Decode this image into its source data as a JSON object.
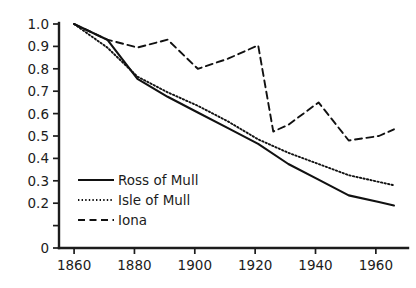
{
  "chart_data": {
    "type": "line",
    "title": "",
    "subtitle": "",
    "xlabel": "",
    "ylabel": "",
    "xlim": [
      1855,
      1968
    ],
    "ylim": [
      0,
      1.0
    ],
    "grid": false,
    "legend_position": "inside-lower-left",
    "x_ticks": [
      1860,
      1880,
      1900,
      1920,
      1940,
      1960
    ],
    "x_tick_labels": [
      "1860",
      "1880",
      "1900",
      "1920",
      "1940",
      "1960"
    ],
    "y_ticks": [
      0,
      0.1,
      0.2,
      0.3,
      0.4,
      0.5,
      0.6,
      0.7,
      0.8,
      0.9,
      1.0
    ],
    "y_tick_labels": [
      "0",
      "",
      "0.2",
      "0.3",
      "0.4",
      "0.5",
      "0.6",
      "0.7",
      "0.8",
      "0.9",
      "1.0"
    ],
    "series": [
      {
        "name": "Ross of Mull",
        "style": "solid",
        "color": "#111111",
        "x": [
          1860,
          1871,
          1881,
          1891,
          1901,
          1911,
          1921,
          1931,
          1941,
          1951,
          1961,
          1966
        ],
        "values": [
          1.0,
          0.93,
          0.755,
          0.675,
          0.605,
          0.535,
          0.465,
          0.375,
          0.305,
          0.235,
          0.205,
          0.19
        ]
      },
      {
        "name": "Isle of Mull",
        "style": "dotted",
        "color": "#111111",
        "x": [
          1860,
          1871,
          1881,
          1891,
          1901,
          1911,
          1921,
          1931,
          1941,
          1951,
          1961,
          1966
        ],
        "values": [
          1.0,
          0.895,
          0.765,
          0.695,
          0.635,
          0.565,
          0.485,
          0.425,
          0.375,
          0.325,
          0.295,
          0.28
        ]
      },
      {
        "name": "Iona",
        "style": "dashed",
        "color": "#111111",
        "x": [
          1860,
          1871,
          1881,
          1891,
          1901,
          1911,
          1921,
          1926,
          1931,
          1941,
          1951,
          1961,
          1966
        ],
        "values": [
          1.0,
          0.93,
          0.895,
          0.93,
          0.8,
          0.845,
          0.905,
          0.52,
          0.55,
          0.65,
          0.48,
          0.5,
          0.53
        ]
      }
    ],
    "legend_entries": [
      {
        "label": "Ross of Mull",
        "style": "solid"
      },
      {
        "label": "Isle of Mull",
        "style": "dotted"
      },
      {
        "label": "Iona",
        "style": "dashed"
      }
    ]
  }
}
